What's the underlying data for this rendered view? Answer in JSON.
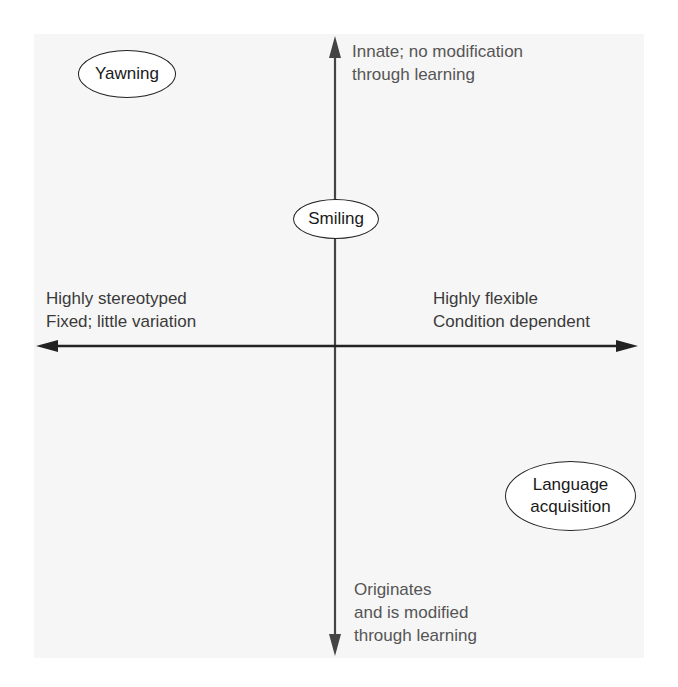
{
  "diagram": {
    "axes": {
      "vertical_top": [
        "Innate; no modification",
        "through learning"
      ],
      "vertical_bottom": [
        "Originates",
        "and is modified",
        "through learning"
      ],
      "horizontal_left": [
        "Highly stereotyped",
        "Fixed; little variation"
      ],
      "horizontal_right": [
        "Highly flexible",
        "Condition dependent"
      ]
    },
    "items": [
      {
        "label": "Yawning"
      },
      {
        "label": "Smiling"
      },
      {
        "label_lines": [
          "Language",
          "acquisition"
        ]
      }
    ],
    "colors": {
      "axis": "#333333",
      "text": "#3a3a3a",
      "oval_border": "#222222"
    }
  }
}
